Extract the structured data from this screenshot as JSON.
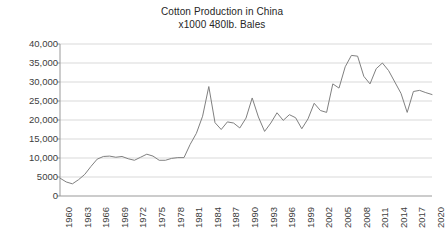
{
  "chart_data": {
    "type": "line",
    "title": "Cotton Production in China",
    "subtitle": "x1000 480lb. Bales",
    "xlabel": "",
    "ylabel": "",
    "ylim": [
      0,
      40000
    ],
    "xlim": [
      1960,
      2020
    ],
    "grid": true,
    "legend": false,
    "line_color": "#808080",
    "y_ticks": [
      0,
      5000,
      10000,
      15000,
      20000,
      25000,
      30000,
      35000,
      40000
    ],
    "y_tick_labels": [
      "0",
      "5000",
      "10,000",
      "15,000",
      "20,000",
      "25,000",
      "30,000",
      "35,000",
      "40,000"
    ],
    "x_ticks": [
      1960,
      1963,
      1966,
      1969,
      1972,
      1975,
      1978,
      1981,
      1984,
      1987,
      1990,
      1993,
      1996,
      1999,
      2002,
      2005,
      2008,
      2011,
      2014,
      2017,
      2020
    ],
    "x_tick_labels": [
      "1960",
      "1963",
      "1966",
      "1969",
      "1972",
      "1975",
      "1978",
      "1981",
      "1984",
      "1987",
      "1990",
      "1993",
      "1996",
      "1999",
      "2002",
      "2005",
      "2008",
      "2011",
      "2014",
      "2017",
      "2020"
    ],
    "x": [
      1960,
      1961,
      1962,
      1963,
      1964,
      1965,
      1966,
      1967,
      1968,
      1969,
      1970,
      1971,
      1972,
      1973,
      1974,
      1975,
      1976,
      1977,
      1978,
      1979,
      1980,
      1981,
      1982,
      1983,
      1984,
      1985,
      1986,
      1987,
      1988,
      1989,
      1990,
      1991,
      1992,
      1993,
      1994,
      1995,
      1996,
      1997,
      1998,
      1999,
      2000,
      2001,
      2002,
      2003,
      2004,
      2005,
      2006,
      2007,
      2008,
      2009,
      2010,
      2011,
      2012,
      2013,
      2014,
      2015,
      2016,
      2017,
      2018,
      2019,
      2020
    ],
    "values": [
      4700,
      3700,
      3200,
      4300,
      5700,
      7800,
      9700,
      10400,
      10500,
      10200,
      10400,
      9800,
      9400,
      10200,
      11000,
      10500,
      9400,
      9400,
      9900,
      10100,
      10100,
      13600,
      16500,
      21000,
      28800,
      19300,
      17500,
      19500,
      19200,
      17900,
      20500,
      25800,
      20800,
      17000,
      19200,
      21900,
      19900,
      21400,
      20600,
      17700,
      20300,
      24400,
      22500,
      22000,
      29500,
      28400,
      34000,
      37000,
      36800,
      31500,
      29500,
      33500,
      35000,
      33000,
      30000,
      27000,
      22000,
      27500,
      27800,
      27200,
      26700
    ]
  },
  "axes": {
    "plot_left": 60,
    "plot_right": 432,
    "plot_top": 44,
    "plot_bottom": 196
  }
}
